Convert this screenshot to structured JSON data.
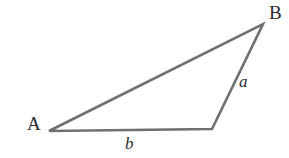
{
  "figure": {
    "kind": "geometry-diagram",
    "shape": "triangle",
    "background_color": "#ffffff",
    "stroke_color": "#707070",
    "label_color": "#2b2b2b",
    "stroke_width": 2.6,
    "width": 289,
    "height": 158
  },
  "vertices": [
    {
      "id": "A",
      "label": "A",
      "x": 49,
      "y": 131,
      "labeled": true
    },
    {
      "id": "B",
      "label": "B",
      "x": 263,
      "y": 24,
      "labeled": true
    },
    {
      "id": "C",
      "label": "",
      "x": 212,
      "y": 129,
      "labeled": false
    }
  ],
  "sides": [
    {
      "id": "a",
      "label": "a",
      "from": "B",
      "to": "C",
      "labeled": true
    },
    {
      "id": "b",
      "label": "b",
      "from": "C",
      "to": "A",
      "labeled": true
    },
    {
      "id": "c",
      "label": "",
      "from": "A",
      "to": "B",
      "labeled": false
    }
  ],
  "labels": {
    "vertex_a": "A",
    "vertex_b": "B",
    "side_a": "a",
    "side_b": "b"
  },
  "geometry": {
    "path": "M 49 131 L 263 24 L 212 129 Z",
    "closed": true
  }
}
